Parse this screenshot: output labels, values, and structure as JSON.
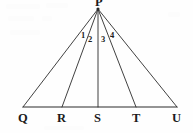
{
  "figure": {
    "kind": "geometry-diagram",
    "stroke_color": "#2b2b2b",
    "background_color": "#fefefe",
    "text_color": "#1b1b1b"
  },
  "apex": {
    "label": "P",
    "x": 98,
    "y": 9
  },
  "baseline": {
    "y": 107,
    "x_start": 23,
    "x_end": 177
  },
  "vertices": [
    {
      "id": "Q",
      "label": "Q",
      "x": 23,
      "y": 107,
      "label_x": 18,
      "label_y": 112
    },
    {
      "id": "R",
      "label": "R",
      "x": 62,
      "y": 107,
      "label_x": 57,
      "label_y": 112
    },
    {
      "id": "S",
      "label": "S",
      "x": 98,
      "y": 107,
      "label_x": 94,
      "label_y": 112
    },
    {
      "id": "T",
      "label": "T",
      "x": 136,
      "y": 107,
      "label_x": 132,
      "label_y": 112
    },
    {
      "id": "U",
      "label": "U",
      "x": 177,
      "y": 107,
      "label_x": 172,
      "label_y": 112
    }
  ],
  "segments": [
    {
      "id": "PQ",
      "from": "P",
      "to": "Q",
      "x1": 98,
      "y1": 9,
      "x2": 23,
      "y2": 107
    },
    {
      "id": "PR",
      "from": "P",
      "to": "R",
      "x1": 98,
      "y1": 9,
      "x2": 62,
      "y2": 107
    },
    {
      "id": "PS",
      "from": "P",
      "to": "S",
      "x1": 98,
      "y1": 9,
      "x2": 98,
      "y2": 107
    },
    {
      "id": "PT",
      "from": "P",
      "to": "T",
      "x1": 98,
      "y1": 9,
      "x2": 136,
      "y2": 107
    },
    {
      "id": "PU",
      "from": "P",
      "to": "U",
      "x1": 98,
      "y1": 9,
      "x2": 177,
      "y2": 107
    },
    {
      "id": "QU",
      "from": "Q",
      "to": "U",
      "x1": 23,
      "y1": 107,
      "x2": 177,
      "y2": 107
    }
  ],
  "angle_labels": [
    {
      "id": "angle-1",
      "label": "1",
      "x": 81,
      "y": 31,
      "between": "PQ-PR"
    },
    {
      "id": "angle-2",
      "label": "2",
      "x": 88,
      "y": 35,
      "between": "PR-PS"
    },
    {
      "id": "angle-3",
      "label": "3",
      "x": 101,
      "y": 35,
      "between": "PS-PT"
    },
    {
      "id": "angle-4",
      "label": "4",
      "x": 110,
      "y": 31,
      "between": "PT-PU"
    }
  ]
}
